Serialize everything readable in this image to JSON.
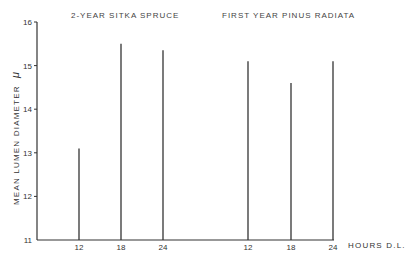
{
  "chart_data": {
    "type": "bar",
    "style": "vertical line bars (spikes)",
    "title": "",
    "groups": [
      {
        "name": "2-YEAR SITKA SPRUCE",
        "categories": [
          "12",
          "18",
          "24"
        ],
        "values": [
          13.1,
          15.5,
          15.35
        ]
      },
      {
        "name": "FIRST YEAR PINUS RADIATA",
        "categories": [
          "12",
          "18",
          "24"
        ],
        "values": [
          15.1,
          14.6,
          15.1
        ]
      }
    ],
    "xlabel": "HOURS D.L.",
    "ylabel": "MEAN LUMEN DIAMETER",
    "ylabel_unit": "μ",
    "ylim": [
      11,
      16
    ],
    "yticks": [
      "11",
      "12",
      "13",
      "14",
      "15",
      "16"
    ],
    "grid": false,
    "legend": "none (group titles above each group)"
  },
  "labels": {
    "group1_title": "2-YEAR SITKA SPRUCE",
    "group2_title": "FIRST YEAR PINUS RADIATA",
    "x_axis_title": "HOURS D.L.",
    "y_axis_title": "MEAN  LUMEN  DIAMETER",
    "y_axis_unit": "μ",
    "y_ticks": [
      "11",
      "12",
      "13",
      "14",
      "15",
      "16"
    ],
    "x_ticks_group1": [
      "12",
      "18",
      "24"
    ],
    "x_ticks_group2": [
      "12",
      "18",
      "24"
    ]
  }
}
